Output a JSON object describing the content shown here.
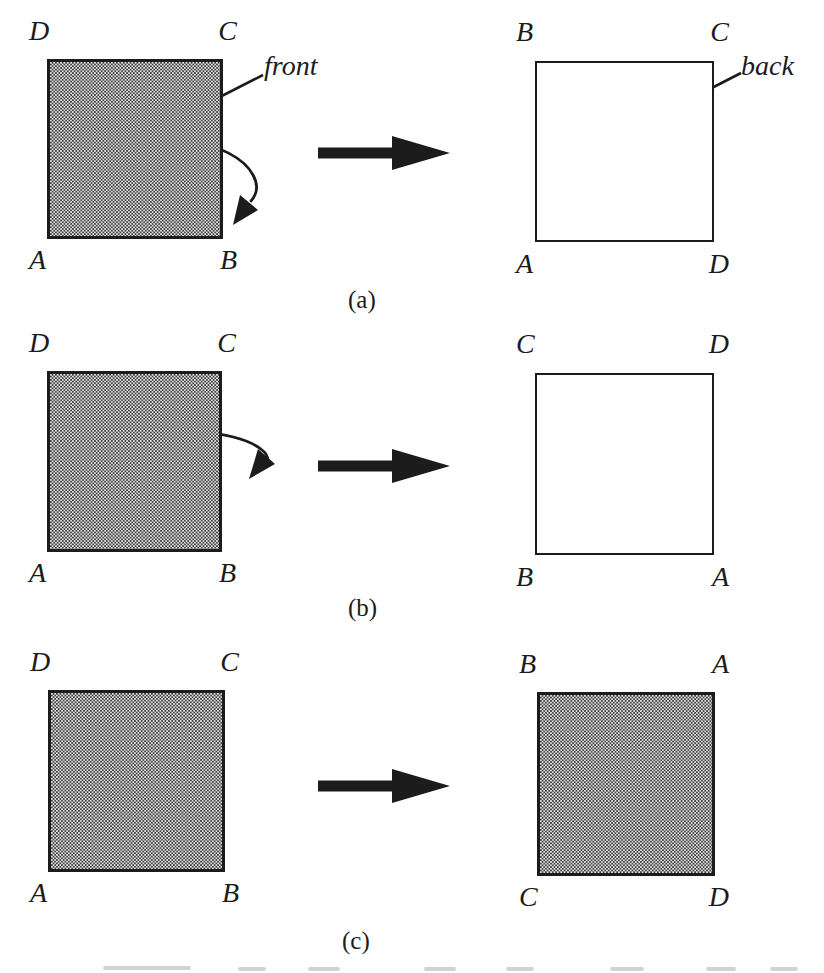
{
  "figure": {
    "panels": [
      {
        "label": "(a)",
        "left": {
          "style": "halftone",
          "annotation": "front",
          "corners": {
            "tl": "D",
            "tr": "C",
            "bl": "A",
            "br": "B"
          }
        },
        "right": {
          "style": "outline",
          "annotation": "back",
          "corners": {
            "tl": "B",
            "tr": "C",
            "bl": "A",
            "br": "D"
          }
        }
      },
      {
        "label": "(b)",
        "left": {
          "style": "halftone",
          "corners": {
            "tl": "D",
            "tr": "C",
            "bl": "A",
            "br": "B"
          }
        },
        "right": {
          "style": "outline",
          "corners": {
            "tl": "C",
            "tr": "D",
            "bl": "B",
            "br": "A"
          }
        }
      },
      {
        "label": "(c)",
        "left": {
          "style": "halftone",
          "corners": {
            "tl": "D",
            "tr": "C",
            "bl": "A",
            "br": "B"
          }
        },
        "right": {
          "style": "halftone",
          "corners": {
            "tl": "B",
            "tr": "A",
            "bl": "C",
            "br": "D"
          }
        }
      }
    ],
    "colors": {
      "ink": "#1c1c1c",
      "halftone_dark": "#3d3d3d",
      "halftone_light": "#e3e3e3",
      "paper": "#ffffff"
    }
  }
}
